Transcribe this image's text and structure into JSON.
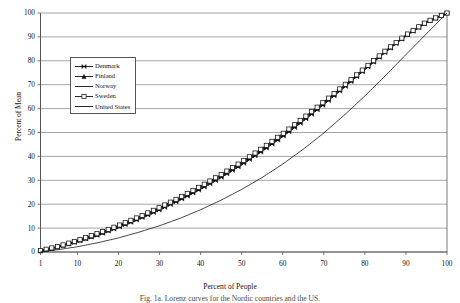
{
  "figure": {
    "caption": "Fig. 1a. Lorenz curves for the Nordic countries and the US."
  },
  "chart_data": {
    "type": "line",
    "title": "",
    "xlabel": "Percent of People",
    "ylabel": "Percent of Mean",
    "xlim": [
      1,
      100
    ],
    "ylim": [
      0,
      100
    ],
    "grid": true,
    "grid_axis": "y",
    "legend_position": "upper-left-inside",
    "xticks": [
      1,
      10,
      20,
      30,
      40,
      50,
      60,
      70,
      80,
      90,
      100
    ],
    "xticklabels": [
      "1",
      "10",
      "20",
      "30",
      "40",
      "50",
      "60",
      "70",
      "80",
      "90",
      "100"
    ],
    "yticks": [
      0,
      10,
      20,
      30,
      40,
      50,
      60,
      70,
      80,
      90,
      100
    ],
    "yticklabels": [
      "0",
      "10",
      "20",
      "30",
      "40",
      "50",
      "60",
      "70",
      "80",
      "90",
      "100"
    ],
    "x": [
      1,
      5,
      10,
      15,
      20,
      25,
      30,
      35,
      40,
      45,
      50,
      55,
      60,
      65,
      70,
      75,
      80,
      85,
      90,
      95,
      100
    ],
    "series": [
      {
        "name": "Denmark",
        "marker": "bowtie",
        "color": "#111111",
        "values": [
          0.4,
          1.9,
          4.3,
          7.1,
          10.3,
          13.8,
          17.6,
          21.8,
          26.3,
          31.2,
          36.5,
          42.2,
          48.3,
          54.8,
          61.7,
          68.9,
          76.3,
          83.6,
          90.4,
          96.0,
          100.0
        ]
      },
      {
        "name": "Finland",
        "marker": "triangle",
        "color": "#111111",
        "values": [
          0.5,
          2.1,
          4.6,
          7.5,
          10.8,
          14.4,
          18.3,
          22.5,
          27.1,
          32.0,
          37.3,
          43.0,
          49.1,
          55.6,
          62.4,
          69.5,
          76.8,
          84.0,
          90.7,
          96.2,
          100.0
        ]
      },
      {
        "name": "Norway",
        "marker": "none",
        "color": "#111111",
        "values": [
          0.4,
          2.0,
          4.4,
          7.3,
          10.5,
          14.0,
          17.9,
          22.1,
          26.7,
          31.6,
          36.9,
          42.6,
          48.7,
          55.2,
          62.0,
          69.2,
          76.5,
          83.8,
          90.5,
          96.1,
          100.0
        ]
      },
      {
        "name": "Sweden",
        "marker": "square",
        "color": "#111111",
        "values": [
          0.6,
          2.2,
          4.8,
          7.8,
          11.1,
          14.7,
          18.6,
          22.9,
          27.5,
          32.4,
          37.7,
          43.4,
          49.5,
          56.0,
          62.8,
          69.8,
          77.0,
          84.2,
          90.8,
          96.3,
          100.0
        ]
      },
      {
        "name": "United States",
        "marker": "none",
        "color": "#111111",
        "values": [
          0.2,
          0.9,
          2.2,
          3.9,
          5.9,
          8.3,
          11.0,
          14.1,
          17.7,
          21.7,
          26.2,
          31.2,
          36.8,
          43.0,
          49.8,
          57.3,
          65.3,
          73.8,
          82.6,
          91.3,
          100.0
        ]
      }
    ]
  },
  "legend": {
    "items": [
      {
        "label": "Denmark",
        "marker": "bowtie-marker"
      },
      {
        "label": "Finland",
        "marker": "triangle-marker"
      },
      {
        "label": "Norway",
        "marker": "line-marker"
      },
      {
        "label": "Sweden",
        "marker": "square-marker"
      },
      {
        "label": "United States",
        "marker": "line-marker"
      }
    ]
  }
}
